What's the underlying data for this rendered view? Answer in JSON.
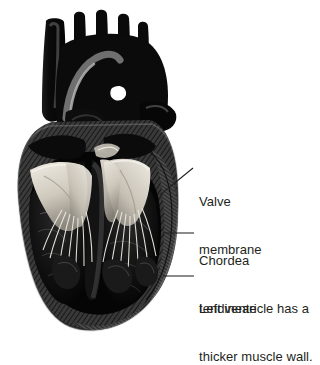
{
  "figure": {
    "background_color": "#ffffff",
    "ink_color": "#1a1a1a",
    "text_color": "#231f20",
    "highlight_color": "#e8e4dc",
    "midtone_color": "#8e8e8e"
  },
  "labels": {
    "valve_membrane": {
      "line1": "Valve",
      "line2": "membrane"
    },
    "chordea_tendineae": {
      "line1": "Chordea",
      "line2": "tendineae"
    },
    "left_ventricle": {
      "line1": "Left ventricle has a",
      "line2": "thicker muscle wall."
    }
  },
  "leader_lines": {
    "valve_membrane": "diagonal-leader-line",
    "chordea_tendineae": "horizontal-leader-line",
    "left_ventricle": "horizontal-leader-line"
  },
  "anatomy": {
    "parts": [
      "superior-vena-cava",
      "aorta",
      "pulmonary-artery",
      "aortic-arch",
      "left-atrium",
      "right-atrium",
      "mitral-valve",
      "tricuspid-valve",
      "chordae-tendineae",
      "interventricular-septum",
      "left-ventricle",
      "right-ventricle",
      "myocardium",
      "apex"
    ]
  }
}
